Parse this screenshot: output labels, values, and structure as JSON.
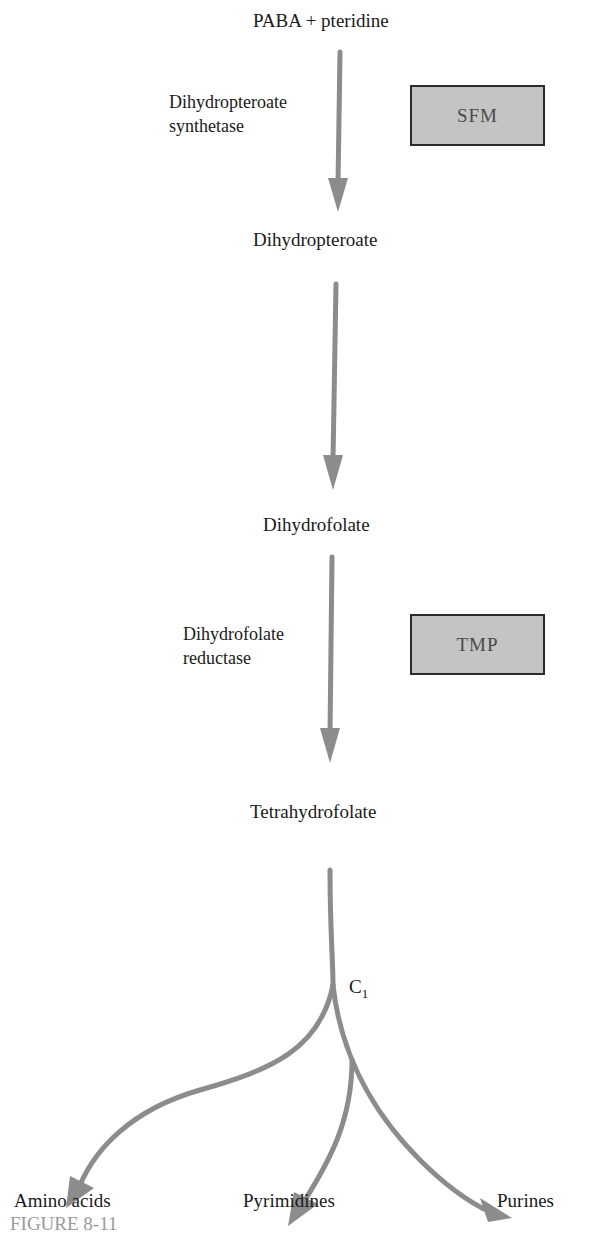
{
  "figure": {
    "caption": "FIGURE 8-11",
    "arrow_color": "#8c8c8c",
    "inhibitor_box_fill": "#c4c4c4"
  },
  "pathway": {
    "substrate": "PABA + pteridine",
    "intermediate_1": "Dihydropteroate",
    "intermediate_2": "Dihydrofolate",
    "product": "Tetrahydrofolate",
    "carrier": "C",
    "carrier_subscript": "1"
  },
  "enzymes": {
    "step1_line1": "Dihydropteroate",
    "step1_line2": "synthetase",
    "step3_line1": "Dihydrofolate",
    "step3_line2": "reductase"
  },
  "inhibitors": {
    "step1": "SFM",
    "step3": "TMP"
  },
  "outputs": {
    "amino_acids": "Amino acids",
    "pyrimidines": "Pyrimidines",
    "purines": "Purines"
  }
}
